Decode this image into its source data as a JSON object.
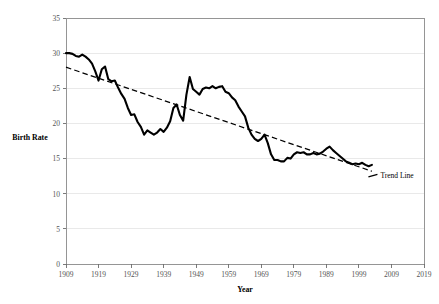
{
  "chart_data": {
    "type": "line",
    "title": "",
    "xlabel": "Year",
    "ylabel": "Birth Rate",
    "xlim": [
      1909,
      2019
    ],
    "ylim": [
      0,
      35
    ],
    "grid": "horizontal",
    "legend_position": "inline-right",
    "x_tick_labels": [
      "1909",
      "1919",
      "1929",
      "1939",
      "1949",
      "1959",
      "1969",
      "1979",
      "1989",
      "1999",
      "2009",
      "2019"
    ],
    "y_tick_labels": [
      "0",
      "5",
      "10",
      "15",
      "20",
      "25",
      "30",
      "35"
    ],
    "x_ticks": [
      1909,
      1919,
      1929,
      1939,
      1949,
      1959,
      1969,
      1979,
      1989,
      1999,
      2009,
      2019
    ],
    "y_ticks": [
      0,
      5,
      10,
      15,
      20,
      25,
      30,
      35
    ],
    "series": [
      {
        "name": "Birth Rate",
        "style": "solid",
        "color": "#000000",
        "x": [
          1909,
          1910,
          1911,
          1912,
          1913,
          1914,
          1915,
          1916,
          1917,
          1918,
          1919,
          1920,
          1921,
          1922,
          1923,
          1924,
          1925,
          1926,
          1927,
          1928,
          1929,
          1930,
          1931,
          1932,
          1933,
          1934,
          1935,
          1936,
          1937,
          1938,
          1939,
          1940,
          1941,
          1942,
          1943,
          1944,
          1945,
          1946,
          1947,
          1948,
          1949,
          1950,
          1951,
          1952,
          1953,
          1954,
          1955,
          1956,
          1957,
          1958,
          1959,
          1960,
          1961,
          1962,
          1963,
          1964,
          1965,
          1966,
          1967,
          1968,
          1969,
          1970,
          1971,
          1972,
          1973,
          1974,
          1975,
          1976,
          1977,
          1978,
          1979,
          1980,
          1981,
          1982,
          1983,
          1984,
          1985,
          1986,
          1987,
          1988,
          1989,
          1990,
          1991,
          1992,
          1993,
          1994,
          1995,
          1996,
          1997,
          1998,
          1999,
          2000,
          2001,
          2002,
          2003
        ],
        "values": [
          30.0,
          30.0,
          29.9,
          29.6,
          29.5,
          29.8,
          29.5,
          29.1,
          28.5,
          27.4,
          26.1,
          27.7,
          28.1,
          26.3,
          26.0,
          26.1,
          25.1,
          24.2,
          23.5,
          22.2,
          21.2,
          21.3,
          20.2,
          19.5,
          18.4,
          19.0,
          18.7,
          18.4,
          18.7,
          19.2,
          18.8,
          19.4,
          20.3,
          22.2,
          22.7,
          21.2,
          20.4,
          24.1,
          26.6,
          24.9,
          24.5,
          24.1,
          24.9,
          25.1,
          25.0,
          25.3,
          25.0,
          25.2,
          25.3,
          24.5,
          24.3,
          23.7,
          23.3,
          22.4,
          21.7,
          21.0,
          19.4,
          18.4,
          17.8,
          17.5,
          17.8,
          18.4,
          17.2,
          15.6,
          14.8,
          14.8,
          14.6,
          14.6,
          15.1,
          15.0,
          15.6,
          15.9,
          15.8,
          15.9,
          15.6,
          15.6,
          15.8,
          15.6,
          15.7,
          16.0,
          16.4,
          16.7,
          16.2,
          15.8,
          15.4,
          15.0,
          14.6,
          14.4,
          14.2,
          14.3,
          14.2,
          14.4,
          14.1,
          13.9,
          14.1
        ]
      },
      {
        "name": "Trend Line",
        "style": "dashed",
        "color": "#000000",
        "x": [
          1909,
          2003
        ],
        "values": [
          28.0,
          13.2
        ]
      }
    ],
    "annotations": [
      {
        "text": "Trend Line",
        "x": 2005,
        "y": 12.6
      }
    ]
  },
  "labels": {
    "y_axis_title": "Birth Rate",
    "x_axis_title": "Year",
    "trend_annotation": "Trend Line"
  }
}
